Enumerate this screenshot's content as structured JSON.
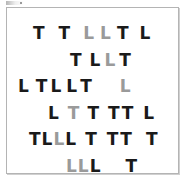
{
  "figure": {
    "name": "visual-search-stimulus-array",
    "background_color": "#ffffff",
    "frame_border_color": "#b4b4b4",
    "target_color_black": "#1a1a1a",
    "distractor_color_gray": "#9a9a9a"
  },
  "stimulus": {
    "letters_used": [
      "T",
      "L"
    ],
    "rows": [
      {
        "row_index": 1,
        "top": 14,
        "left": 26,
        "items": [
          {
            "char": "T",
            "color": "#1a1a1a",
            "gap_after": 14
          },
          {
            "char": "T",
            "color": "#1a1a1a",
            "gap_after": 13
          },
          {
            "char": "L",
            "color": "#9a9a9a",
            "gap_after": 6
          },
          {
            "char": "L",
            "color": "#9a9a9a",
            "gap_after": 6
          },
          {
            "char": "T",
            "color": "#1a1a1a",
            "gap_after": 11
          },
          {
            "char": "L",
            "color": "#1a1a1a",
            "gap_after": 0
          }
        ]
      },
      {
        "row_index": 2,
        "top": 41,
        "left": 63,
        "items": [
          {
            "char": "T",
            "color": "#1a1a1a",
            "gap_after": 8
          },
          {
            "char": "L",
            "color": "#1a1a1a",
            "gap_after": 4
          },
          {
            "char": "L",
            "color": "#9a9a9a",
            "gap_after": 4
          },
          {
            "char": "T",
            "color": "#1a1a1a",
            "gap_after": 0
          }
        ]
      },
      {
        "row_index": 3,
        "top": 67,
        "left": 11,
        "items": [
          {
            "char": "L",
            "color": "#1a1a1a",
            "gap_after": 7
          },
          {
            "char": "T",
            "color": "#1a1a1a",
            "gap_after": 3
          },
          {
            "char": "L",
            "color": "#1a1a1a",
            "gap_after": 5
          },
          {
            "char": "L",
            "color": "#1a1a1a",
            "gap_after": 3
          },
          {
            "char": "T",
            "color": "#1a1a1a",
            "gap_after": 28
          },
          {
            "char": "L",
            "color": "#9a9a9a",
            "gap_after": 0
          }
        ]
      },
      {
        "row_index": 4,
        "top": 94,
        "left": 41,
        "items": [
          {
            "char": "L",
            "color": "#1a1a1a",
            "gap_after": 9
          },
          {
            "char": "T",
            "color": "#9a9a9a",
            "gap_after": 8
          },
          {
            "char": "T",
            "color": "#1a1a1a",
            "gap_after": 9
          },
          {
            "char": "T",
            "color": "#1a1a1a",
            "gap_after": 2
          },
          {
            "char": "T",
            "color": "#1a1a1a",
            "gap_after": 10
          },
          {
            "char": "L",
            "color": "#1a1a1a",
            "gap_after": 0
          }
        ]
      },
      {
        "row_index": 5,
        "top": 120,
        "left": 22,
        "items": [
          {
            "char": "T",
            "color": "#1a1a1a",
            "gap_after": 1
          },
          {
            "char": "L",
            "color": "#1a1a1a",
            "gap_after": 1
          },
          {
            "char": "L",
            "color": "#9a9a9a",
            "gap_after": 1
          },
          {
            "char": "L",
            "color": "#1a1a1a",
            "gap_after": 9
          },
          {
            "char": "T",
            "color": "#1a1a1a",
            "gap_after": 10
          },
          {
            "char": "T",
            "color": "#1a1a1a",
            "gap_after": 2
          },
          {
            "char": "T",
            "color": "#1a1a1a",
            "gap_after": 14
          },
          {
            "char": "T",
            "color": "#1a1a1a",
            "gap_after": 0
          }
        ]
      },
      {
        "row_index": 6,
        "top": 147,
        "left": 59,
        "items": [
          {
            "char": "L",
            "color": "#9a9a9a",
            "gap_after": 1
          },
          {
            "char": "L",
            "color": "#9a9a9a",
            "gap_after": 1
          },
          {
            "char": "L",
            "color": "#1a1a1a",
            "gap_after": 25
          },
          {
            "char": "T",
            "color": "#1a1a1a",
            "gap_after": 0
          }
        ]
      }
    ]
  }
}
